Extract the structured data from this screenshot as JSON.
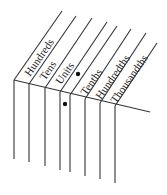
{
  "diagram": {
    "type": "place-value-chart",
    "columns": [
      {
        "label": "Hundreds"
      },
      {
        "label": "Tens"
      },
      {
        "label": "Units"
      },
      {
        "label": "Tenths"
      },
      {
        "label": "Hundredths"
      },
      {
        "label": "Thousandths"
      }
    ],
    "decimal_point_marker": "•",
    "colors": {
      "line": "#333333",
      "text": "#222222",
      "background": "#ffffff"
    }
  }
}
